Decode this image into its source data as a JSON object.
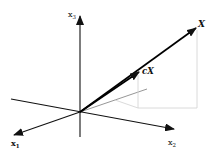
{
  "diagram": {
    "axes": [
      {
        "id": "x1",
        "label": "x",
        "subscript": "1"
      },
      {
        "id": "x2",
        "label": "x",
        "subscript": "2"
      },
      {
        "id": "x3",
        "label": "x",
        "subscript": "3"
      }
    ],
    "vectors": [
      {
        "id": "X",
        "label": "X"
      },
      {
        "id": "cX",
        "label": "cX",
        "scalar": "c",
        "base": "X"
      }
    ],
    "colors": {
      "axis": "#111111",
      "vector": "#000000",
      "projection": "#c8c8c8",
      "projection_dark": "#8a8a8a"
    }
  }
}
